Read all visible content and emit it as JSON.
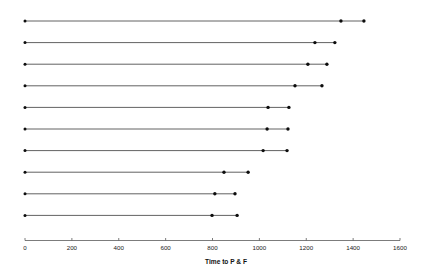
{
  "chart_data": {
    "type": "line",
    "title": "",
    "subtitle": "",
    "xlabel": "Time to P & F",
    "ylabel": "",
    "xlim": [
      0,
      1600
    ],
    "ylim": [
      0,
      11
    ],
    "grid": false,
    "legend": null,
    "xticks": [
      0,
      200,
      400,
      600,
      800,
      1000,
      1200,
      1400,
      1600
    ],
    "xtick_labels": [
      "0",
      "200",
      "400",
      "600",
      "800",
      "1000",
      "1200",
      "1400",
      "1600"
    ],
    "yticks": [],
    "ytick_labels": [],
    "series_note": "Ten horizontal interval lines, each starting at 0 with an interior marker and a terminal marker.",
    "rows": [
      {
        "id": "row-1",
        "start": 0,
        "mid": 1348,
        "end": 1446
      },
      {
        "id": "row-2",
        "start": 0,
        "mid": 1237,
        "end": 1322
      },
      {
        "id": "row-3",
        "start": 0,
        "mid": 1207,
        "end": 1288
      },
      {
        "id": "row-4",
        "start": 0,
        "mid": 1152,
        "end": 1267
      },
      {
        "id": "row-5",
        "start": 0,
        "mid": 1037,
        "end": 1126
      },
      {
        "id": "row-6",
        "start": 0,
        "mid": 1033,
        "end": 1122
      },
      {
        "id": "row-7",
        "start": 0,
        "mid": 1016,
        "end": 1118
      },
      {
        "id": "row-8",
        "start": 0,
        "mid": 849,
        "end": 952
      },
      {
        "id": "row-9",
        "start": 0,
        "mid": 810,
        "end": 896
      },
      {
        "id": "row-10",
        "start": 0,
        "mid": 798,
        "end": 905
      }
    ]
  },
  "colors": {
    "line": "#3a3a3a",
    "marker": "#0d0d0d",
    "axis": "#5a5a5a",
    "text": "#111111",
    "background": "#ffffff"
  }
}
